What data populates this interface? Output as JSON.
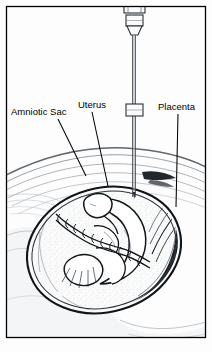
{
  "figure": {
    "background_color": "#fdfdfd",
    "frame_color": "#000000",
    "ink_color": "#000000",
    "wall_line_color": "#8a8f96",
    "shadow_color": "#b9bec4",
    "placenta_color": "#14181c",
    "labels": [
      {
        "id": "amniotic-sac",
        "text": "Amniotic Sac",
        "text_x": 11,
        "text_y": 115,
        "leader": "M 58 119 L 86 176"
      },
      {
        "id": "uterus",
        "text": "Uterus",
        "text_x": 78,
        "text_y": 108,
        "leader": "M 92 112 L 108 186"
      },
      {
        "id": "placenta",
        "text": "Placenta",
        "text_x": 158,
        "text_y": 110,
        "leader": "M 178 114 L 176 207"
      }
    ],
    "needle": {
      "id": "amniocentesis-needle",
      "shaft_x": 134,
      "shaft_top": 33,
      "shaft_tip_y": 197,
      "hub_top_y": 6,
      "collar_y": 107
    },
    "anatomy": {
      "uterus_center_x": 104,
      "uterus_center_y": 250,
      "uterus_rx": 78,
      "uterus_ry": 62,
      "uterus_rotation": -16
    }
  }
}
